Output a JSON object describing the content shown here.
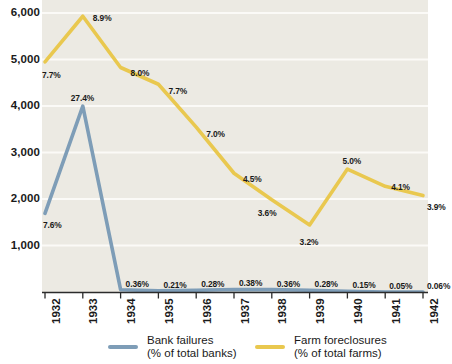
{
  "chart_data": {
    "type": "line",
    "title": "",
    "subtitle": "",
    "xlabel": "",
    "ylabel": "",
    "categories": [
      "1932",
      "1933",
      "1934",
      "1935",
      "1936",
      "1937",
      "1938",
      "1939",
      "1940",
      "1941",
      "1942"
    ],
    "ylim": [
      0,
      6000
    ],
    "yticks": [
      1000,
      2000,
      3000,
      4000,
      5000,
      6000
    ],
    "ytick_labels": [
      "1,000",
      "2,000",
      "3,000",
      "4,000",
      "5,000",
      "6,000"
    ],
    "grid": true,
    "legend_position": "bottom",
    "plot_background": "#eceae3",
    "series": [
      {
        "name": "Bank failures",
        "unit": "(% of total banks)",
        "color": "#7e9db7",
        "values": [
          1700,
          4000,
          60,
          35,
          48,
          65,
          62,
          48,
          26,
          9,
          10
        ],
        "point_labels": [
          "7.6%",
          "27.4%",
          "0.36%",
          "0.21%",
          "0.28%",
          "0.38%",
          "0.36%",
          "0.28%",
          "0.15%",
          "0.05%",
          "0.06%"
        ]
      },
      {
        "name": "Farm foreclosures",
        "unit": "(% of total farms)",
        "color": "#e9c84f",
        "values": [
          4950,
          5930,
          4830,
          4470,
          3550,
          2560,
          1990,
          1450,
          2650,
          2280,
          2080
        ],
        "point_labels": [
          "7.7%",
          "8.9%",
          "8.0%",
          "7.7%",
          "7.0%",
          "4.5%",
          "3.6%",
          "3.2%",
          "5.0%",
          "4.1%",
          "3.9%"
        ]
      }
    ]
  },
  "legend": {
    "items": [
      {
        "name_line1": "Bank failures",
        "name_line2": "(% of total banks)",
        "color": "#7e9db7"
      },
      {
        "name_line1": "Farm foreclosures",
        "name_line2": "(% of total farms)",
        "color": "#e9c84f"
      }
    ]
  },
  "axis": {
    "y_labels": [
      "6,000",
      "5,000",
      "4,000",
      "3,000",
      "2,000",
      "1,000"
    ],
    "x_labels": [
      "1932",
      "1933",
      "1934",
      "1935",
      "1936",
      "1937",
      "1938",
      "1939",
      "1940",
      "1941",
      "1942"
    ]
  },
  "point_labels": {
    "bank": [
      "7.6%",
      "27.4%",
      "0.36%",
      "0.21%",
      "0.28%",
      "0.38%",
      "0.36%",
      "0.28%",
      "0.15%",
      "0.05%",
      "0.06%"
    ],
    "farm": [
      "7.7%",
      "8.9%",
      "8.0%",
      "7.7%",
      "7.0%",
      "4.5%",
      "3.6%",
      "3.2%",
      "5.0%",
      "4.1%",
      "3.9%"
    ]
  },
  "colors": {
    "bank_line": "#7e9db7",
    "farm_line": "#e9c84f",
    "plot_bg": "#eceae3",
    "gridline": "#f8f7f3",
    "text": "#1a1a1a",
    "axis": "#3a3a3a"
  }
}
